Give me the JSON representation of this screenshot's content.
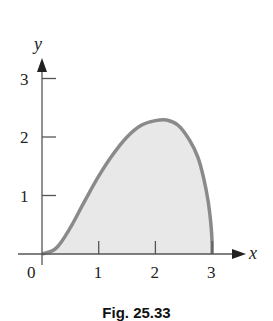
{
  "chart_data": {
    "type": "area",
    "title": "",
    "caption": "Fig. 25.33",
    "xlabel": "x",
    "ylabel": "y",
    "xlim": [
      0,
      3
    ],
    "ylim": [
      0,
      3
    ],
    "x_ticks": [
      "0",
      "1",
      "2",
      "3"
    ],
    "y_ticks": [
      "1",
      "2",
      "3"
    ],
    "grid": false,
    "legend": null,
    "series": [
      {
        "name": "bounded region",
        "x": [
          0,
          0.25,
          0.5,
          0.75,
          1.0,
          1.25,
          1.5,
          1.75,
          2.0,
          2.2,
          2.4,
          2.6,
          2.75,
          2.85,
          2.93,
          2.98,
          3.0,
          3.0
        ],
        "values": [
          0,
          0.1,
          0.45,
          0.9,
          1.33,
          1.7,
          2.0,
          2.2,
          2.28,
          2.29,
          2.2,
          1.95,
          1.65,
          1.3,
          0.9,
          0.5,
          0.2,
          0
        ],
        "fill": "#e8e8e8",
        "stroke": "#8a8a8a"
      }
    ],
    "annotations": [
      "origin label 0"
    ]
  },
  "colors": {
    "fill": "#e8e8e8",
    "curve": "#8a8a8a",
    "axis": "#555555",
    "text": "#222222"
  }
}
